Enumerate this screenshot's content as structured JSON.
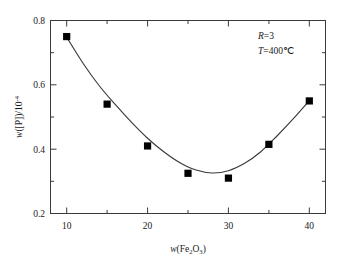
{
  "chart_data": {
    "type": "scatter",
    "title": "",
    "subtitle": "",
    "xlabel": "w(Fe2O3)",
    "xlabel_parts": {
      "lead": "w",
      "open": "(Fe",
      "sub1": "2",
      "mid": "O",
      "sub2": "3",
      "close": ")"
    },
    "ylabel": "w([P])/10-4",
    "ylabel_parts": {
      "lead": "w",
      "body": "([P])/10",
      "exp": "-4"
    },
    "xlim": [
      8,
      42
    ],
    "ylim": [
      0.2,
      0.8
    ],
    "xticks": [
      10,
      20,
      30,
      40
    ],
    "xticklabels": [
      "10",
      "20",
      "30",
      "40"
    ],
    "xminorticks": [
      15,
      25,
      35
    ],
    "yticks": [
      0.2,
      0.4,
      0.6,
      0.8
    ],
    "yticklabels": [
      "0.2",
      "0.4",
      "0.6",
      "0.8"
    ],
    "yminorticks": [
      0.3,
      0.5,
      0.7
    ],
    "grid": false,
    "legend": null,
    "marker": "filled-square",
    "marker_color": "#000000",
    "line_color": "#3a3a3a",
    "x": [
      10,
      15,
      20,
      25,
      30,
      35,
      40
    ],
    "values": [
      0.75,
      0.54,
      0.41,
      0.325,
      0.31,
      0.415,
      0.55
    ],
    "series": [
      {
        "name": "w([P])",
        "x": [
          10,
          15,
          20,
          25,
          30,
          35,
          40
        ],
        "values": [
          0.75,
          0.54,
          0.41,
          0.325,
          0.31,
          0.415,
          0.55
        ]
      }
    ],
    "fit_curve": {
      "description": "smooth U-shaped fitted curve through data, minimum near x=28",
      "x": [
        10,
        12,
        14,
        16,
        18,
        20,
        22,
        24,
        26,
        28,
        30,
        32,
        34,
        36,
        38,
        40
      ],
      "y": [
        0.748,
        0.668,
        0.598,
        0.539,
        0.484,
        0.434,
        0.392,
        0.358,
        0.335,
        0.326,
        0.333,
        0.356,
        0.392,
        0.441,
        0.494,
        0.551
      ]
    },
    "annotations": [
      {
        "id": "ratio",
        "symbol": "R",
        "relation": "=",
        "value": "3"
      },
      {
        "id": "temperature",
        "symbol": "T",
        "relation": "=",
        "value": "400℃"
      }
    ]
  }
}
